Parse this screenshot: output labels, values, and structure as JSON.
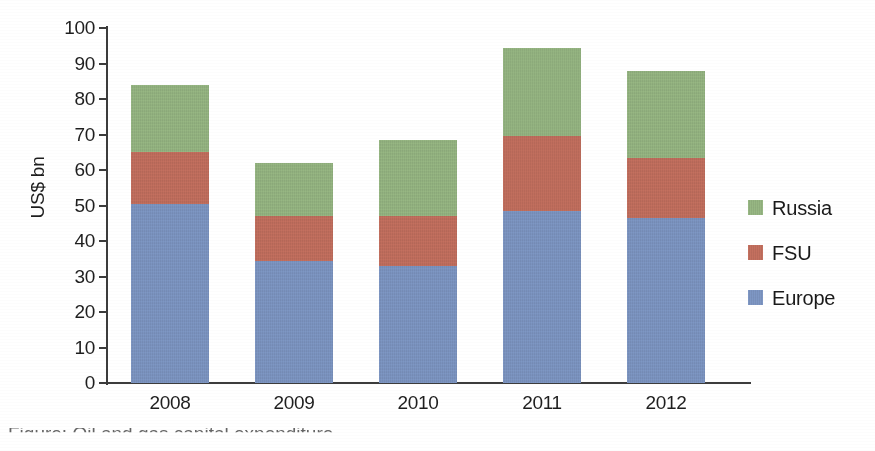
{
  "chart_data": {
    "type": "bar",
    "subtype": "stacked-bar",
    "title": "",
    "xlabel": "",
    "ylabel": "US$ bn",
    "categories": [
      "2008",
      "2009",
      "2010",
      "2011",
      "2012"
    ],
    "ylim": [
      0,
      100
    ],
    "ytick_step": 10,
    "yticks": [
      "100",
      "90",
      "80",
      "70",
      "60",
      "50",
      "40",
      "30",
      "20",
      "10",
      "0"
    ],
    "grid": false,
    "legend_position": "right",
    "series": [
      {
        "name": "Europe",
        "color": "#7e97c4",
        "values": [
          50.5,
          34.5,
          33.0,
          48.5,
          46.5
        ]
      },
      {
        "name": "FSU",
        "color": "#c4705f",
        "values": [
          14.5,
          12.5,
          14.0,
          21.0,
          17.0
        ]
      },
      {
        "name": "Russia",
        "color": "#97b783",
        "values": [
          19.0,
          15.0,
          21.5,
          25.0,
          24.5
        ]
      }
    ],
    "stack_order_bottom_to_top": [
      "Europe",
      "FSU",
      "Russia"
    ],
    "totals": [
      84.0,
      62.0,
      68.5,
      94.5,
      88.0
    ]
  },
  "legend": {
    "items": [
      {
        "label": "Russia",
        "color": "#97b783"
      },
      {
        "label": "FSU",
        "color": "#c4705f"
      },
      {
        "label": "Europe",
        "color": "#7e97c4"
      }
    ]
  },
  "caption": {
    "text": "Figure: Oil and gas capital expenditure"
  }
}
